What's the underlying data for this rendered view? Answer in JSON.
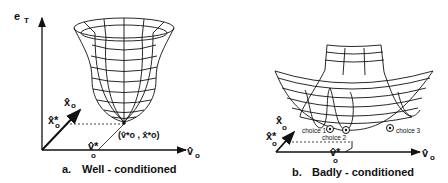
{
  "panel_a": {
    "caption_letter": "a.",
    "caption": "Well - conditioned",
    "axis_vertical": "e",
    "axis_vertical_sub": "T",
    "axis_depth": "x̂",
    "axis_depth_sub": "o",
    "axis_horizontal": "v̂",
    "axis_horizontal_sub": "o",
    "x_star_label": "x̂*",
    "x_star_sub": "o",
    "v_star_label": "v̂*",
    "v_star_sub": "o",
    "minimum_label": "(v̂*o , x̂*o)"
  },
  "panel_b": {
    "caption_letter": "b.",
    "caption": "Badly - conditioned",
    "axis_depth": "x̂",
    "axis_depth_sub": "o",
    "axis_horizontal": "v̂",
    "axis_horizontal_sub": "o",
    "x_star_label": "x̂*",
    "x_star_sub": "o",
    "v_star_label": "v̂*",
    "v_star_sub": "o",
    "choices": [
      "choice 1",
      "choice 2",
      "choice 3"
    ]
  },
  "colors": {
    "ink": "#111111",
    "background": "#ffffff"
  }
}
